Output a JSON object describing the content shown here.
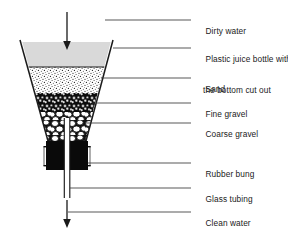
{
  "diagram": {
    "colors": {
      "outline": "#1a1a1a",
      "dirty_water_fill": "#d8d8d8",
      "sand_fill": "#ffffff",
      "sand_speckle": "#2b2b2b",
      "fine_gravel_fill": "#111111",
      "coarse_gravel_fill": "#ffffff",
      "coarse_gravel_outline": "#0d0d0d",
      "rubber_bung_fill": "#0a0a0a",
      "leader_line": "#3a3a3a",
      "text": "#1a1a1a"
    },
    "labels": [
      {
        "id": "dirty-water",
        "line1": "Dirty water",
        "line2": "",
        "x": 196,
        "y": 15,
        "leader_y": 20,
        "leader_x1": 105,
        "leader_x2": 191
      },
      {
        "id": "plastic-bottle",
        "line1": "Plastic juice bottle with",
        "line2": "the bottom cut out",
        "x": 196,
        "y": 43,
        "leader_y": 48,
        "leader_x1": 113,
        "leader_x2": 191
      },
      {
        "id": "sand",
        "line1": "Sand",
        "line2": "",
        "x": 196,
        "y": 73,
        "leader_y": 78,
        "leader_x1": 101,
        "leader_x2": 191
      },
      {
        "id": "fine-gravel",
        "line1": "Fine gravel",
        "line2": "",
        "x": 196,
        "y": 98,
        "leader_y": 103,
        "leader_x1": 92,
        "leader_x2": 191
      },
      {
        "id": "coarse-gravel",
        "line1": "Coarse gravel",
        "line2": "",
        "x": 196,
        "y": 118,
        "leader_y": 123,
        "leader_x1": 86,
        "leader_x2": 191
      },
      {
        "id": "rubber-bung",
        "line1": "Rubber bung",
        "line2": "",
        "x": 196,
        "y": 158,
        "leader_y": 163,
        "leader_x1": 88,
        "leader_x2": 191
      },
      {
        "id": "glass-tubing",
        "line1": "Glass tubing",
        "line2": "",
        "x": 196,
        "y": 183,
        "leader_y": 188,
        "leader_x1": 70,
        "leader_x2": 191
      },
      {
        "id": "clean-water",
        "line1": "Clean water",
        "line2": "",
        "x": 196,
        "y": 207,
        "leader_y": 212,
        "leader_x1": 68,
        "leader_x2": 191
      }
    ],
    "arrows": [
      {
        "id": "inflow-arrow",
        "x": 67,
        "y1": 12,
        "y2": 48
      },
      {
        "id": "outflow-arrow",
        "x": 67,
        "y1": 200,
        "y2": 227
      }
    ],
    "layers": [
      {
        "id": "dirty-water-layer",
        "name": "Dirty water",
        "top": 42,
        "bottom": 67
      },
      {
        "id": "sand-layer",
        "name": "Sand",
        "top": 67,
        "bottom": 93
      },
      {
        "id": "fine-gravel-layer",
        "name": "Fine gravel",
        "top": 93,
        "bottom": 112
      },
      {
        "id": "coarse-gravel-layer",
        "name": "Coarse gravel",
        "top": 112,
        "bottom": 141
      },
      {
        "id": "rubber-bung-layer",
        "name": "Rubber bung",
        "top": 141,
        "bottom": 170
      }
    ],
    "funnel": {
      "top_left_x": 20,
      "top_right_x": 113,
      "top_y": 40,
      "bottom_left_x": 48,
      "bottom_right_x": 86,
      "bottom_y": 141
    },
    "tubing": {
      "left_x": 64,
      "right_x": 70,
      "top_y": 118,
      "bottom_y": 198
    }
  }
}
